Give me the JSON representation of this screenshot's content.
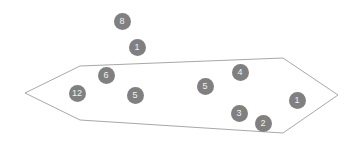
{
  "scene": {
    "background_color": "#ffffff",
    "width": 353,
    "height": 148
  },
  "plane": {
    "name": "ground-plane",
    "shape": "parallelogram",
    "stroke_color": "#a8a8a8",
    "fill_color": "none",
    "stroke_width": 1,
    "points": "25,93 80,66 283,58 338,95 283,133 80,120"
  },
  "markers": {
    "fill_color": "#808080",
    "text_color": "#f2f2f2",
    "items": [
      {
        "id": "marker-8",
        "label": "8",
        "x": 122,
        "y": 21,
        "size": 17,
        "font_size": 9
      },
      {
        "id": "marker-1-top",
        "label": "1",
        "x": 137,
        "y": 47,
        "size": 17,
        "font_size": 9
      },
      {
        "id": "marker-6",
        "label": "6",
        "x": 106,
        "y": 75,
        "size": 17,
        "font_size": 9
      },
      {
        "id": "marker-4",
        "label": "4",
        "x": 240,
        "y": 72,
        "size": 17,
        "font_size": 9
      },
      {
        "id": "marker-5-mid",
        "label": "5",
        "x": 205,
        "y": 86,
        "size": 17,
        "font_size": 9
      },
      {
        "id": "marker-12",
        "label": "12",
        "x": 77,
        "y": 93,
        "size": 17,
        "font_size": 9
      },
      {
        "id": "marker-5-low",
        "label": "5",
        "x": 135,
        "y": 95,
        "size": 17,
        "font_size": 9
      },
      {
        "id": "marker-1-right",
        "label": "1",
        "x": 297,
        "y": 100,
        "size": 17,
        "font_size": 9
      },
      {
        "id": "marker-3",
        "label": "3",
        "x": 239,
        "y": 113,
        "size": 17,
        "font_size": 9
      },
      {
        "id": "marker-2",
        "label": "2",
        "x": 263,
        "y": 123,
        "size": 17,
        "font_size": 9
      }
    ]
  }
}
